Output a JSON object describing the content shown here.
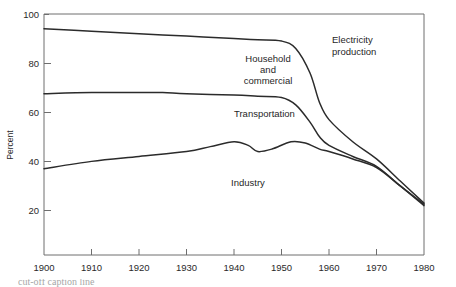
{
  "chart_data": {
    "type": "line",
    "title": "",
    "subtitle": "",
    "xlabel": "",
    "ylabel": "Percent",
    "xlim": [
      1900,
      1980
    ],
    "ylim": [
      0,
      100
    ],
    "xticks": [
      1900,
      1910,
      1920,
      1930,
      1940,
      1950,
      1960,
      1970,
      1980
    ],
    "xtick_labels": [
      "1900",
      "1910",
      "1920",
      "1930",
      "1940",
      "1950",
      "1960",
      "1970",
      "1980"
    ],
    "yticks": [
      20,
      40,
      60,
      80,
      100
    ],
    "ytick_labels": [
      "20",
      "40",
      "60",
      "80",
      "100"
    ],
    "grid": false,
    "legend_position": "inline-annotations",
    "line_color": "#2b2b2b",
    "axis_color": "#6e6e6e",
    "series": [
      {
        "name": "Electricity production",
        "x": [
          1900,
          1910,
          1920,
          1930,
          1940,
          1945,
          1950,
          1953,
          1956,
          1958,
          1960,
          1965,
          1970,
          1975,
          1980
        ],
        "values": [
          94,
          93,
          92,
          91,
          90,
          89.5,
          89,
          86,
          76,
          64,
          57,
          48,
          41,
          32,
          23
        ]
      },
      {
        "name": "Household and commercial",
        "x": [
          1900,
          1910,
          1920,
          1925,
          1930,
          1940,
          1945,
          1950,
          1953,
          1956,
          1958,
          1960,
          1965,
          1970,
          1975,
          1980
        ],
        "values": [
          67.5,
          68,
          68,
          68,
          67.5,
          67,
          66.5,
          66,
          63,
          56,
          50,
          46.5,
          42,
          38,
          30,
          22.5
        ]
      },
      {
        "name": "Transportation",
        "x": [
          1900,
          1910,
          1920,
          1930,
          1935,
          1940,
          1943,
          1945,
          1948,
          1952,
          1955,
          1958,
          1960,
          1965,
          1970,
          1975,
          1980
        ],
        "values": [
          37,
          40,
          42,
          44,
          46,
          48,
          46.5,
          44,
          45,
          48,
          47.5,
          45,
          44,
          41,
          37.5,
          30,
          22
        ]
      }
    ],
    "annotations": [
      {
        "text": "Electricity production",
        "lines": [
          "Electricity",
          "production"
        ],
        "x": 1962,
        "y": 85
      },
      {
        "text": "Household and commercial",
        "lines": [
          "Household",
          "and",
          "commercial"
        ],
        "x": 1947,
        "y": 76
      },
      {
        "text": "Transportation",
        "lines": [
          "Transportation"
        ],
        "x": 1944,
        "y": 58
      },
      {
        "text": "Industry",
        "lines": [
          "Industry"
        ],
        "x": 1943,
        "y": 32
      }
    ]
  },
  "axis": {
    "y_title": "Percent"
  },
  "caption": {
    "text": "cut-off caption line"
  }
}
